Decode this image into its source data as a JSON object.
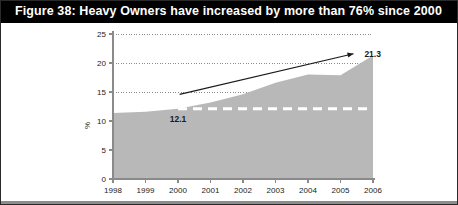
{
  "figure": {
    "title": "Figure 38: Heavy Owners have increased by more than 76% since 2000",
    "title_bar_color": "#000000",
    "title_text_color": "#ffffff",
    "background_color": "#ffffff",
    "border_color": "#2a2a2a"
  },
  "chart_data": {
    "type": "area",
    "title": "Figure 38: Heavy Owners have increased by more than 76% since 2000",
    "xlabel": "",
    "ylabel": "%",
    "categories": [
      "1998",
      "1999",
      "2000",
      "2001",
      "2002",
      "2003",
      "2004",
      "2005",
      "2006"
    ],
    "x": [
      1998,
      1999,
      2000,
      2001,
      2002,
      2003,
      2004,
      2005,
      2006
    ],
    "values": [
      11.4,
      11.6,
      12.1,
      13.2,
      14.6,
      16.6,
      18.0,
      17.9,
      21.3
    ],
    "series": [
      {
        "name": "Heavy Owners",
        "values": [
          11.4,
          11.6,
          12.1,
          13.2,
          14.6,
          16.6,
          18.0,
          17.9,
          21.3
        ],
        "fill_color": "#b8b8b8"
      }
    ],
    "ylim": [
      0,
      25
    ],
    "yticks": [
      0,
      5,
      10,
      15,
      20,
      25
    ],
    "ytick_labels": [
      "0",
      "5",
      "10",
      "15",
      "20",
      "25"
    ],
    "xlim": [
      1998,
      2006
    ],
    "grid": true,
    "grid_style": "dotted",
    "grid_color": "#8a8a8a",
    "legend": false,
    "legend_position": "none",
    "axis_color": "#8a8a8a",
    "annotations": [
      {
        "name": "start-value",
        "label": "12.1",
        "x": 2000,
        "y": 12.1,
        "role": "arrow-tail-value"
      },
      {
        "name": "end-value",
        "label": "21.3",
        "x": 2005.55,
        "y": 21.6,
        "role": "arrow-head-value"
      }
    ],
    "arrow": {
      "name": "growth-arrow",
      "from_x": 2000.05,
      "from_y": 14.6,
      "to_x": 2005.4,
      "to_y": 21.6,
      "color": "#1a1a1a"
    },
    "reference_line": {
      "name": "baseline-reference",
      "value": 12.1,
      "from_x": 2000.0,
      "to_x": 2006,
      "color": "#ffffff",
      "style": "dashed"
    }
  }
}
